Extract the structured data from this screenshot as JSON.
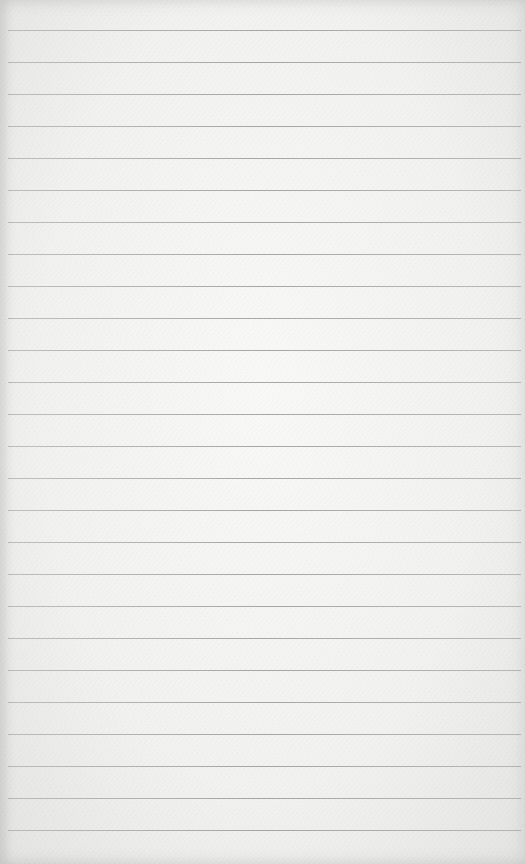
{
  "paper": {
    "type": "lined",
    "background_color": "#f3f3f2",
    "line_color": "#9a9a9a",
    "first_line_y": 30,
    "line_spacing": 32,
    "line_count": 26
  }
}
